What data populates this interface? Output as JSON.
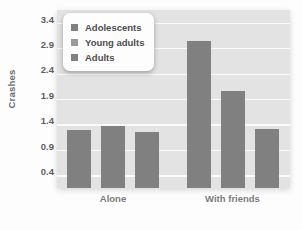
{
  "chart_data": {
    "type": "bar",
    "title": "",
    "subtitle": "",
    "xlabel": "",
    "ylabel": "Crashes",
    "categories": [
      "Alone",
      "With friends"
    ],
    "series": [
      {
        "name": "Adolescents",
        "values": [
          1.3,
          3.05
        ],
        "color": "#808080"
      },
      {
        "name": "Young adults",
        "values": [
          1.37,
          2.06
        ],
        "color": "#808080"
      },
      {
        "name": "Adults",
        "values": [
          1.25,
          1.32
        ],
        "color": "#808080"
      }
    ],
    "ylim": [
      0.15,
      3.65
    ],
    "yticks": [
      "0.4",
      "0.9",
      "1.4",
      "1.9",
      "2.4",
      "2.9",
      "3.4"
    ],
    "ytick_values": [
      0.4,
      0.9,
      1.4,
      1.9,
      2.4,
      2.9,
      3.4
    ],
    "grid": "horizontal-white-gridlines",
    "legend_position": "top-left-inside",
    "background": "#e3e3e3",
    "bar_color": "#808080",
    "gridline_color": "#fbfbfb",
    "text_color": "#5e5e5e"
  },
  "legend": {
    "items": [
      {
        "label": "Adolescents",
        "color": "#808080"
      },
      {
        "label": "Young adults",
        "color": "#9a9a9a"
      },
      {
        "label": "Adults",
        "color": "#808080"
      }
    ]
  },
  "axes": {
    "y_title": "Crashes",
    "y_ticks": [
      "3.4",
      "2.9",
      "2.4",
      "1.9",
      "1.4",
      "0.9",
      "0.4"
    ],
    "x_ticks": [
      "Alone",
      "With friends"
    ]
  }
}
